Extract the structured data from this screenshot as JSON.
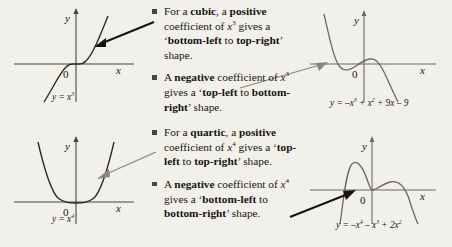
{
  "document": {
    "topic": "Shapes of cubic and quartic graphs"
  },
  "bullets": [
    {
      "id": "cubic-positive",
      "segments": [
        {
          "t": "For a ",
          "style": "plain"
        },
        {
          "t": "cubic",
          "style": "bold"
        },
        {
          "t": ", a ",
          "style": "plain"
        },
        {
          "t": "positive",
          "style": "bold"
        },
        {
          "t": " coefficient of ",
          "style": "plain"
        },
        {
          "t": "x",
          "style": "italic"
        },
        {
          "t": "3",
          "style": "sup"
        },
        {
          "t": " gives a ‘",
          "style": "plain"
        },
        {
          "t": "bottom-left",
          "style": "bold"
        },
        {
          "t": " to ",
          "style": "plain"
        },
        {
          "t": "top-right",
          "style": "bold"
        },
        {
          "t": "’ shape.",
          "style": "plain"
        }
      ]
    },
    {
      "id": "cubic-negative",
      "segments": [
        {
          "t": "A ",
          "style": "plain"
        },
        {
          "t": "negative",
          "style": "bold"
        },
        {
          "t": " coefficient of ",
          "style": "plain"
        },
        {
          "t": "x",
          "style": "italic"
        },
        {
          "t": "3",
          "style": "sup"
        },
        {
          "t": " gives a ‘",
          "style": "plain"
        },
        {
          "t": "top-left",
          "style": "bold"
        },
        {
          "t": " to ",
          "style": "plain"
        },
        {
          "t": "bottom-right",
          "style": "bold"
        },
        {
          "t": "’ shape.",
          "style": "plain"
        }
      ]
    },
    {
      "id": "quartic-positive",
      "segments": [
        {
          "t": "For a ",
          "style": "plain"
        },
        {
          "t": "quartic",
          "style": "bold"
        },
        {
          "t": ", a ",
          "style": "plain"
        },
        {
          "t": "positive",
          "style": "bold"
        },
        {
          "t": " coefficient of ",
          "style": "plain"
        },
        {
          "t": "x",
          "style": "italic"
        },
        {
          "t": "4",
          "style": "sup"
        },
        {
          "t": " gives a ‘",
          "style": "plain"
        },
        {
          "t": "top-left",
          "style": "bold"
        },
        {
          "t": " to ",
          "style": "plain"
        },
        {
          "t": "top-right",
          "style": "bold"
        },
        {
          "t": "’ shape.",
          "style": "plain"
        }
      ]
    },
    {
      "id": "quartic-negative",
      "segments": [
        {
          "t": "A ",
          "style": "plain"
        },
        {
          "t": "negative",
          "style": "bold"
        },
        {
          "t": " coefficient of ",
          "style": "plain"
        },
        {
          "t": "x",
          "style": "italic"
        },
        {
          "t": "4",
          "style": "sup"
        },
        {
          "t": " gives a ‘",
          "style": "plain"
        },
        {
          "t": "bottom-left",
          "style": "bold"
        },
        {
          "t": " to ",
          "style": "plain"
        },
        {
          "t": "bottom-right",
          "style": "bold"
        },
        {
          "t": "’ shape.",
          "style": "plain"
        }
      ]
    }
  ],
  "graphs": [
    {
      "id": "graph-cubic-positive",
      "equation_plain": "y = x3",
      "equation_parts": {
        "lhs": "y = ",
        "base": "x",
        "exp": "3"
      },
      "axis_x_label": "x",
      "axis_y_label": "y",
      "origin_label": "0",
      "shape": "bottom-left to top-right"
    },
    {
      "id": "graph-quartic-positive",
      "equation_plain": "y = x4",
      "equation_parts": {
        "lhs": "y = ",
        "base": "x",
        "exp": "4"
      },
      "axis_x_label": "x",
      "axis_y_label": "y",
      "origin_label": "0",
      "shape": "top-left to top-right"
    },
    {
      "id": "graph-cubic-negative",
      "equation_plain": "y = -x3 + x2 + 9x - 9",
      "axis_x_label": "x",
      "axis_y_label": "y",
      "origin_label": "0",
      "shape": "top-left to bottom-right"
    },
    {
      "id": "graph-quartic-negative",
      "equation_plain": "y = -x4 - x3 + 2x2",
      "axis_x_label": "x",
      "axis_y_label": "y",
      "origin_label": "0",
      "shape": "bottom-left to bottom-right"
    }
  ],
  "colors": {
    "background": "#f2f0ea",
    "text": "#17140f",
    "curve_dark": "#2b2824",
    "curve_gray": "#6d6962",
    "axis": "#4a4640",
    "arrow_dark": "#17140f",
    "arrow_gray": "#8a867e",
    "bullet_square": "#4a4640"
  }
}
